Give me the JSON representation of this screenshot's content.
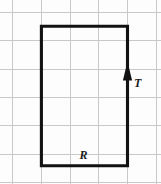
{
  "figure": {
    "background_color": "#fdfdfd",
    "width": 161,
    "height": 184
  },
  "grid": {
    "line_color": "#c9c9c9",
    "spacing_px": 28.7,
    "vertical_x": [
      12.8,
      41.4,
      70.1,
      98.8,
      127.5,
      156.2
    ],
    "horizontal_y": [
      12.6,
      40.9,
      69.2,
      97.5,
      125.8,
      154.1,
      182.4
    ]
  },
  "loop": {
    "name": "rectangle-loop",
    "color": "#121212",
    "stroke_width": 3.1,
    "left_x": 41.4,
    "right_x": 127.5,
    "top_y": 26.2,
    "bottom_y": 165.8
  },
  "arrow": {
    "name": "current-direction-arrow",
    "direction": "up",
    "color": "#121212",
    "x": 127.5,
    "tip_y": 61.5,
    "base_y": 80.5,
    "half_width": 4.6
  },
  "labels": {
    "current": {
      "text": "T",
      "x": 134.0,
      "y": 87.0
    },
    "resistance": {
      "text": "R",
      "x": 79.5,
      "y": 159.0
    }
  },
  "chart_data": {
    "type": "diagram",
    "elements": [
      {
        "kind": "rectangle",
        "label": "",
        "x0": 41.4,
        "y0": 26.2,
        "x1": 127.5,
        "y1": 165.8,
        "stroke": "#121212"
      },
      {
        "kind": "arrowhead",
        "label": "T",
        "on_edge": "right",
        "direction": "up",
        "x": 127.5,
        "y": 71.0
      },
      {
        "kind": "text-label",
        "label": "R",
        "near_edge": "bottom",
        "x": 79.5,
        "y": 159.0
      }
    ],
    "grid": true,
    "legend": []
  }
}
